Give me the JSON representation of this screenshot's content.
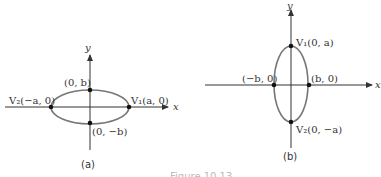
{
  "figure": {
    "caption_partial": "Figure 10.13",
    "panels": [
      {
        "id": "a",
        "caption": "(a)",
        "axis_x_label": "x",
        "axis_y_label": "y",
        "orientation": "horizontal major axis",
        "points": {
          "top": "(0, b)",
          "bottom": "(0, −b)",
          "left": "V₂(−a, 0)",
          "right": "V₁(a, 0)"
        }
      },
      {
        "id": "b",
        "caption": "(b)",
        "axis_x_label": "x",
        "axis_y_label": "y",
        "orientation": "vertical major axis",
        "points": {
          "top": "V₁(0, a)",
          "bottom": "V₂(0, −a)",
          "left": "(−b, 0)",
          "right": "(b, 0)"
        }
      }
    ],
    "colors": {
      "ellipse": "#777777",
      "axes": "#333333",
      "points": "#111111"
    }
  }
}
